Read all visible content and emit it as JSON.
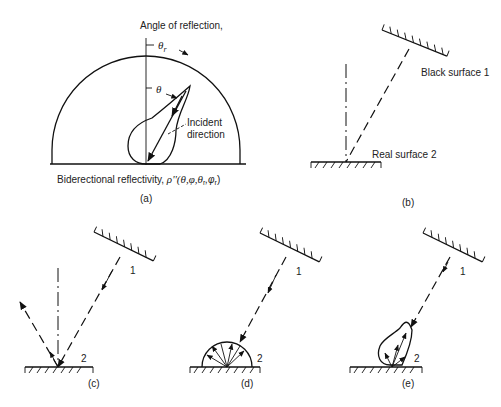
{
  "figure": {
    "panels": [
      {
        "id": "a",
        "caption": "(a)"
      },
      {
        "id": "b",
        "caption": "(b)"
      },
      {
        "id": "c",
        "caption": "(c)"
      },
      {
        "id": "d",
        "caption": "(d)"
      },
      {
        "id": "e",
        "caption": "(e)"
      }
    ]
  },
  "panel_a": {
    "angle_label": "Angle of reflection,",
    "theta_r": "θ",
    "theta_r_sub": "r",
    "theta": "θ",
    "incident_label_1": "Incident",
    "incident_label_2": "direction",
    "bottom_label": "Biderectional reflectivity, ",
    "bottom_formula": "ρ''(θ,φ,θ",
    "bottom_formula_sub1": "r",
    "bottom_formula_mid": ",φ",
    "bottom_formula_sub2": "r",
    "bottom_formula_end": ")",
    "caption": "(a)"
  },
  "panel_b": {
    "surface1_label": "Black surface 1",
    "surface2_label": "Real surface 2",
    "caption": "(b)"
  },
  "panel_c": {
    "surface1_label": "1",
    "surface2_label": "2",
    "caption": "(c)"
  },
  "panel_d": {
    "surface1_label": "1",
    "surface2_label": "2",
    "caption": "(d)"
  },
  "panel_e": {
    "surface1_label": "1",
    "surface2_label": "2",
    "caption": "(e)"
  }
}
